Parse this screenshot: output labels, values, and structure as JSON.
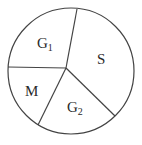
{
  "diagram": {
    "type": "cell-cycle-pie",
    "stroke_color": "#444444",
    "background": "#ffffff",
    "segments": [
      {
        "id": "g1",
        "label": "G",
        "subscript": "1"
      },
      {
        "id": "s",
        "label": "S",
        "subscript": ""
      },
      {
        "id": "g2",
        "label": "G",
        "subscript": "2"
      },
      {
        "id": "m",
        "label": "M",
        "subscript": ""
      }
    ]
  }
}
